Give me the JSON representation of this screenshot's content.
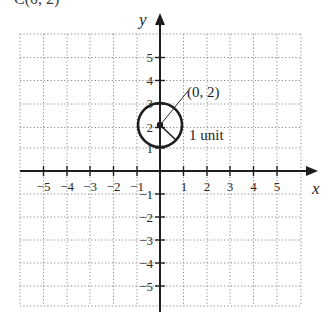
{
  "diagram": {
    "type": "coordinate-plane-circle",
    "cut_off_top_text": "C(0, 2)",
    "axes": {
      "x_label": "x",
      "y_label": "y",
      "x_ticks": [
        "−5",
        "−4",
        "−3",
        "−2",
        "−1",
        "1",
        "2",
        "3",
        "4",
        "5"
      ],
      "y_ticks_positive": [
        "5",
        "4",
        "3",
        "2",
        "1"
      ],
      "y_ticks_negative": [
        "−1",
        "−2",
        "−3",
        "−4",
        "−5"
      ]
    },
    "circle": {
      "center": [
        0,
        2
      ],
      "radius": 1,
      "center_label": "(0, 2)",
      "radius_label": "1 unit"
    },
    "colors": {
      "axis": "#1e1e1e",
      "grid": "#8a8a8a",
      "circle": "#1e1e1e",
      "background": "#ffffff"
    }
  }
}
